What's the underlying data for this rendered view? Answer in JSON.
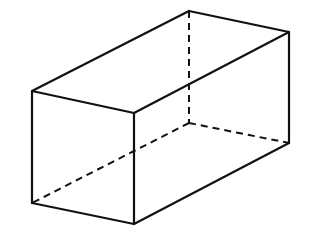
{
  "diagram": {
    "title": "",
    "type": "rectangular-prism",
    "stroke_color": "#111111",
    "background": "#ffffff",
    "vertices": {
      "front_top_left": [
        32,
        91
      ],
      "front_top_right": [
        134,
        113
      ],
      "front_bottom_left": [
        32,
        203
      ],
      "front_bottom_right": [
        134,
        224
      ],
      "back_top_left": [
        189,
        11
      ],
      "back_top_right": [
        289,
        32
      ],
      "back_bottom_left": [
        189,
        123
      ],
      "back_bottom_right": [
        289,
        143
      ]
    },
    "visible_edges": [
      [
        "front_top_left",
        "front_top_right"
      ],
      [
        "front_top_right",
        "front_bottom_right"
      ],
      [
        "front_bottom_right",
        "front_bottom_left"
      ],
      [
        "front_bottom_left",
        "front_top_left"
      ],
      [
        "front_top_left",
        "back_top_left"
      ],
      [
        "back_top_left",
        "back_top_right"
      ],
      [
        "back_top_right",
        "front_top_right"
      ],
      [
        "back_top_right",
        "back_bottom_right"
      ],
      [
        "back_bottom_right",
        "front_bottom_right"
      ]
    ],
    "hidden_edges": [
      [
        "back_top_left",
        "back_bottom_left"
      ],
      [
        "back_bottom_left",
        "back_bottom_right"
      ],
      [
        "back_bottom_left",
        "front_bottom_left"
      ]
    ]
  }
}
